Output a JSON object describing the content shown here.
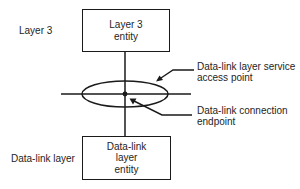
{
  "diagram": {
    "layer_labels": {
      "top": "Layer 3",
      "bottom": "Data-link layer"
    },
    "entities": {
      "top": {
        "line1": "Layer 3",
        "line2": "entity"
      },
      "bottom": {
        "line1": "Data-link",
        "line2": "layer",
        "line3": "entity"
      }
    },
    "annotations": {
      "sap": {
        "line1": "Data-link layer service",
        "line2": "access point"
      },
      "cep": {
        "line1": "Data-link connection",
        "line2": "endpoint"
      }
    },
    "colors": {
      "stroke": "#1a1a1a",
      "background": "#ffffff"
    }
  }
}
